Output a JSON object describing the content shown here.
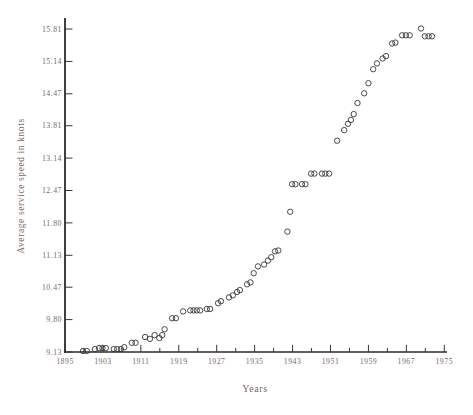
{
  "colors": {
    "background": "#ffffff",
    "axis": "#2e2a28",
    "tick": "#3a3533",
    "label": "#7a6a63",
    "point_stroke": "#3b3634"
  },
  "chart_data": {
    "type": "scatter",
    "title": "",
    "xlabel": "Years",
    "ylabel": "Average service speed in knots",
    "marker": "open-circle",
    "grid": false,
    "legend": false,
    "xlim": [
      1895,
      1976
    ],
    "ylim": [
      9.13,
      16.04
    ],
    "x_tick_values": [
      1895,
      1903,
      1911,
      1919,
      1927,
      1935,
      1943,
      1951,
      1959,
      1967,
      1975
    ],
    "x_tick_labels": [
      "1895",
      "1903",
      "1911",
      "1919",
      "1927",
      "1935",
      "1943",
      "1951",
      "1959",
      "1967",
      "1975"
    ],
    "x_minor_tick_values": [
      1899,
      1907,
      1915,
      1923,
      1931,
      1939,
      1947,
      1955,
      1963,
      1971
    ],
    "y_tick_values": [
      9.13,
      9.8,
      10.47,
      11.13,
      11.8,
      12.47,
      13.14,
      13.81,
      14.47,
      15.14,
      15.81
    ],
    "y_tick_labels": [
      "9.13",
      "9.80",
      "10.47",
      "11.13",
      "11.80",
      "12.47",
      "13.14",
      "13.81",
      "14.47",
      "15.14",
      "15.81"
    ],
    "points": [
      [
        1898.8,
        9.15
      ],
      [
        1899.6,
        9.15
      ],
      [
        1901.3,
        9.19
      ],
      [
        1902.2,
        9.21
      ],
      [
        1902.9,
        9.21
      ],
      [
        1903.6,
        9.21
      ],
      [
        1905.3,
        9.19
      ],
      [
        1906.0,
        9.19
      ],
      [
        1906.8,
        9.19
      ],
      [
        1907.5,
        9.23
      ],
      [
        1909.1,
        9.32
      ],
      [
        1909.9,
        9.32
      ],
      [
        1911.9,
        9.44
      ],
      [
        1912.9,
        9.4
      ],
      [
        1913.9,
        9.48
      ],
      [
        1914.9,
        9.42
      ],
      [
        1915.5,
        9.48
      ],
      [
        1916.0,
        9.6
      ],
      [
        1917.6,
        9.83
      ],
      [
        1918.4,
        9.83
      ],
      [
        1919.9,
        9.97
      ],
      [
        1921.4,
        9.99
      ],
      [
        1922.1,
        9.99
      ],
      [
        1922.8,
        9.99
      ],
      [
        1923.5,
        9.99
      ],
      [
        1924.9,
        10.02
      ],
      [
        1925.6,
        10.02
      ],
      [
        1927.3,
        10.14
      ],
      [
        1927.9,
        10.18
      ],
      [
        1929.6,
        10.26
      ],
      [
        1930.4,
        10.3
      ],
      [
        1931.3,
        10.37
      ],
      [
        1931.9,
        10.41
      ],
      [
        1933.4,
        10.53
      ],
      [
        1934.1,
        10.57
      ],
      [
        1934.8,
        10.76
      ],
      [
        1935.7,
        10.9
      ],
      [
        1937.0,
        10.94
      ],
      [
        1937.8,
        11.02
      ],
      [
        1938.5,
        11.09
      ],
      [
        1939.3,
        11.21
      ],
      [
        1940.0,
        11.23
      ],
      [
        1941.9,
        11.62
      ],
      [
        1942.5,
        12.03
      ],
      [
        1942.9,
        12.6
      ],
      [
        1943.6,
        12.6
      ],
      [
        1945.0,
        12.6
      ],
      [
        1945.7,
        12.6
      ],
      [
        1946.9,
        12.82
      ],
      [
        1947.6,
        12.82
      ],
      [
        1949.2,
        12.82
      ],
      [
        1949.9,
        12.82
      ],
      [
        1950.7,
        12.82
      ],
      [
        1952.4,
        13.5
      ],
      [
        1953.9,
        13.72
      ],
      [
        1954.7,
        13.85
      ],
      [
        1955.3,
        13.93
      ],
      [
        1955.9,
        14.05
      ],
      [
        1956.7,
        14.28
      ],
      [
        1958.1,
        14.48
      ],
      [
        1959.0,
        14.69
      ],
      [
        1960.0,
        14.98
      ],
      [
        1960.8,
        15.1
      ],
      [
        1962.0,
        15.2
      ],
      [
        1962.7,
        15.25
      ],
      [
        1964.0,
        15.51
      ],
      [
        1964.7,
        15.53
      ],
      [
        1966.1,
        15.68
      ],
      [
        1966.9,
        15.68
      ],
      [
        1967.7,
        15.68
      ],
      [
        1970.1,
        15.82
      ],
      [
        1970.9,
        15.66
      ],
      [
        1971.7,
        15.66
      ],
      [
        1972.4,
        15.66
      ]
    ]
  }
}
